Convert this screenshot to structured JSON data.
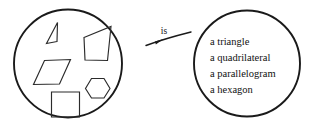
{
  "figure": {
    "type": "set-mapping-diagram",
    "relation_label": "is",
    "background_color": "#ffffff",
    "ink_color": "#1a1a1a"
  },
  "left_set": {
    "name": "shapes-set",
    "circle": {
      "cx": 68,
      "cy": 63.5,
      "r": 54
    },
    "members": [
      {
        "id": "triangle",
        "icon": "triangle-shape",
        "points": "57,41.5 46.5,43.5 57.5,22.5"
      },
      {
        "id": "quadrilateral",
        "icon": "quadrilateral-shape",
        "points": "84,37.5 111,26.5 107.5,60.5 85,60"
      },
      {
        "id": "parallelogram",
        "icon": "parallelogram-shape",
        "points": "44.5,60.5 70.5,59.5 59.5,84 33.5,84.5"
      },
      {
        "id": "hexagon",
        "icon": "hexagon-shape",
        "points": "91.5,78.5 104,78.5 110,88.5 104,98 91.5,98 85.5,88.5"
      },
      {
        "id": "square",
        "icon": "square-shape",
        "points": "51.5,92 79.5,92 79.5,117 51.5,117"
      }
    ]
  },
  "arrow": {
    "name": "is-relation-arrow",
    "label": "is",
    "label_x": 164,
    "label_y": 34,
    "curve_path": "M 146 45.5 Q 165 38.5 191 32",
    "head_points": "163.5,39.0 155.0,41.6 155.8,44.6"
  },
  "right_set": {
    "name": "names-set",
    "circle": {
      "cx": 247,
      "cy": 63.5,
      "r": 53
    },
    "lines": [
      {
        "text": "a triangle",
        "x": 210,
        "y": 45
      },
      {
        "text": "a quadrilateral",
        "x": 210,
        "y": 61
      },
      {
        "text": "a parallelogram",
        "x": 210,
        "y": 77
      },
      {
        "text": "a hexagon",
        "x": 210,
        "y": 93
      }
    ]
  }
}
